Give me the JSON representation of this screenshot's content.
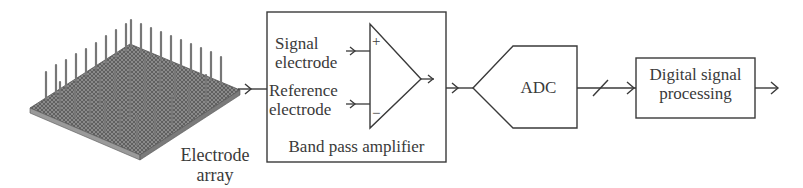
{
  "diagram": {
    "blocks": {
      "electrode_array": {
        "label_line1": "Electrode",
        "label_line2": "array"
      },
      "amplifier": {
        "label": "Band pass amplifier",
        "input_signal_line1": "Signal",
        "input_signal_line2": "electrode",
        "input_reference_line1": "Reference",
        "input_reference_line2": "electrode",
        "plus_sign": "+",
        "minus_sign": "−"
      },
      "adc": {
        "label": "ADC"
      },
      "dsp": {
        "label_line1": "Digital signal",
        "label_line2": "processing"
      }
    },
    "connections": [
      {
        "from": "electrode_array",
        "to": "amplifier"
      },
      {
        "from": "amplifier",
        "to": "adc"
      },
      {
        "from": "adc",
        "to": "dsp",
        "style": "bus"
      },
      {
        "from": "dsp",
        "to": "output"
      }
    ],
    "colors": {
      "stroke": "#3a3a3a",
      "background": "#ffffff"
    }
  }
}
